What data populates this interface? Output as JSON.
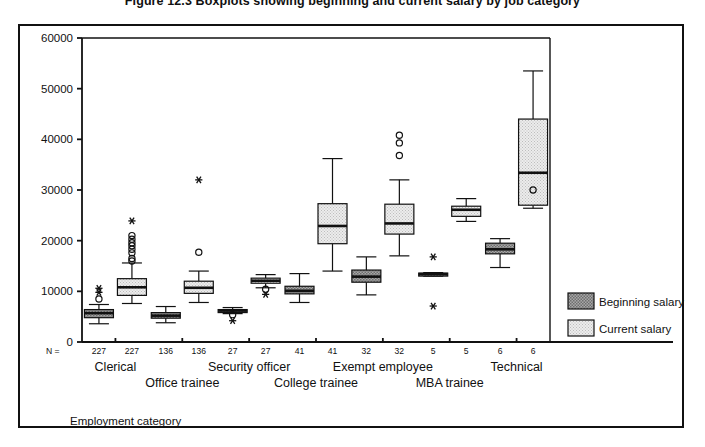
{
  "figure": {
    "title": "Figure 12.3  Boxplots showing beginning and current salary by job category",
    "axis_title_x": "Employment category",
    "n_prefix": "N ="
  },
  "legend": {
    "position": "right",
    "items": [
      {
        "label": "Beginning salary",
        "key": "beginning",
        "fill": "#9a9a9a"
      },
      {
        "label": "Current salary",
        "key": "current",
        "fill": "#e2e2e2"
      }
    ]
  },
  "chart_data": {
    "type": "box",
    "title": "Boxplots showing beginning and current salary by job category",
    "xlabel": "Employment category",
    "ylabel": "",
    "ylim": [
      0,
      60000
    ],
    "yticks": [
      0,
      10000,
      20000,
      30000,
      40000,
      50000,
      60000
    ],
    "ytick_labels": [
      "0",
      "10000",
      "20000",
      "30000",
      "40000",
      "50000",
      "60000"
    ],
    "grid": false,
    "legend_position": "right",
    "categories": [
      "Clerical",
      "Office trainee",
      "Security officer",
      "College trainee",
      "Exempt employee",
      "MBA trainee",
      "Technical"
    ],
    "counts": {
      "beginning": [
        227,
        136,
        27,
        41,
        32,
        5,
        6
      ],
      "current": [
        227,
        136,
        27,
        41,
        32,
        5,
        6
      ]
    },
    "series": [
      {
        "name": "Beginning salary",
        "key": "beginning",
        "boxes": [
          {
            "category": "Clerical",
            "n": 227,
            "whisker_low": 3600,
            "q1": 4800,
            "median": 5700,
            "q3": 6400,
            "whisker_high": 7400,
            "outliers": [
              8500
            ],
            "extremes": [
              9800,
              10600
            ]
          },
          {
            "category": "Office trainee",
            "n": 136,
            "whisker_low": 3800,
            "q1": 4700,
            "median": 5200,
            "q3": 5800,
            "whisker_high": 7000,
            "outliers": [],
            "extremes": []
          },
          {
            "category": "Security officer",
            "n": 27,
            "whisker_low": 5600,
            "q1": 6000,
            "median": 6200,
            "q3": 6400,
            "whisker_high": 6800,
            "outliers": [
              5400
            ],
            "extremes": [
              4200
            ]
          },
          {
            "category": "College trainee",
            "n": 41,
            "whisker_low": 7800,
            "q1": 9500,
            "median": 10100,
            "q3": 11000,
            "whisker_high": 13500,
            "outliers": [],
            "extremes": []
          },
          {
            "category": "Exempt employee",
            "n": 32,
            "whisker_low": 9300,
            "q1": 11800,
            "median": 12900,
            "q3": 14200,
            "whisker_high": 16800,
            "outliers": [],
            "extremes": []
          },
          {
            "category": "MBA trainee",
            "n": 5,
            "whisker_low": 13000,
            "q1": 13100,
            "median": 13400,
            "q3": 13600,
            "whisker_high": 13700,
            "outliers": [],
            "extremes": [
              7100,
              16800
            ]
          },
          {
            "category": "Technical",
            "n": 6,
            "whisker_low": 14700,
            "q1": 17400,
            "median": 18300,
            "q3": 19500,
            "whisker_high": 20400,
            "outliers": [],
            "extremes": []
          }
        ]
      },
      {
        "name": "Current salary",
        "key": "current",
        "boxes": [
          {
            "category": "Clerical",
            "n": 227,
            "whisker_low": 7600,
            "q1": 9200,
            "median": 10800,
            "q3": 12500,
            "whisker_high": 15600,
            "outliers": [
              16000,
              16500,
              17600,
              18300,
              19000,
              19600,
              20300,
              21000
            ],
            "extremes": [
              23900
            ]
          },
          {
            "category": "Office trainee",
            "n": 136,
            "whisker_low": 7800,
            "q1": 9600,
            "median": 10700,
            "q3": 12000,
            "whisker_high": 14000,
            "outliers": [
              17700
            ],
            "extremes": [
              32000
            ]
          },
          {
            "category": "Security officer",
            "n": 27,
            "whisker_low": 10700,
            "q1": 11600,
            "median": 12100,
            "q3": 12600,
            "whisker_high": 13300,
            "outliers": [
              10400
            ],
            "extremes": [
              9400
            ]
          },
          {
            "category": "College trainee",
            "n": 41,
            "whisker_low": 14000,
            "q1": 19400,
            "median": 22900,
            "q3": 27300,
            "whisker_high": 36200,
            "outliers": [],
            "extremes": []
          },
          {
            "category": "Exempt employee",
            "n": 32,
            "whisker_low": 17000,
            "q1": 21300,
            "median": 23400,
            "q3": 27200,
            "whisker_high": 32000,
            "outliers": [
              36800,
              39300,
              40800
            ],
            "extremes": []
          },
          {
            "category": "MBA trainee",
            "n": 5,
            "whisker_low": 23800,
            "q1": 24800,
            "median": 26100,
            "q3": 26800,
            "whisker_high": 28300,
            "outliers": [],
            "extremes": []
          },
          {
            "category": "Technical",
            "n": 6,
            "whisker_low": 26400,
            "q1": 27000,
            "median": 33400,
            "q3": 44000,
            "whisker_high": 53500,
            "outliers": [
              30000
            ],
            "extremes": []
          }
        ]
      }
    ]
  }
}
